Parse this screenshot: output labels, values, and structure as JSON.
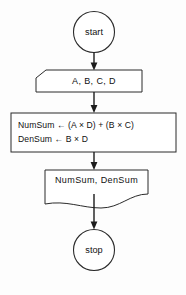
{
  "diagram": {
    "type": "flowchart",
    "orientation": "vertical",
    "colors": {
      "background": "#fdfdfd",
      "stroke": "#2b2b2b",
      "connector": "#1c1c1c",
      "text": "#111111"
    },
    "nodes": [
      {
        "id": "start",
        "shape": "terminal-circle",
        "label": "start"
      },
      {
        "id": "input",
        "shape": "input-card",
        "label": "A, B, C, D"
      },
      {
        "id": "process",
        "shape": "process-rectangle",
        "lines": [
          "NumSum ← (A × D) + (B × C)",
          "DenSum ← B × D"
        ]
      },
      {
        "id": "output",
        "shape": "document",
        "label": "NumSum, DenSum"
      },
      {
        "id": "stop",
        "shape": "terminal-circle",
        "label": "stop"
      }
    ],
    "edges": [
      {
        "from": "start",
        "to": "input"
      },
      {
        "from": "input",
        "to": "process"
      },
      {
        "from": "process",
        "to": "output"
      },
      {
        "from": "output",
        "to": "stop"
      }
    ]
  }
}
